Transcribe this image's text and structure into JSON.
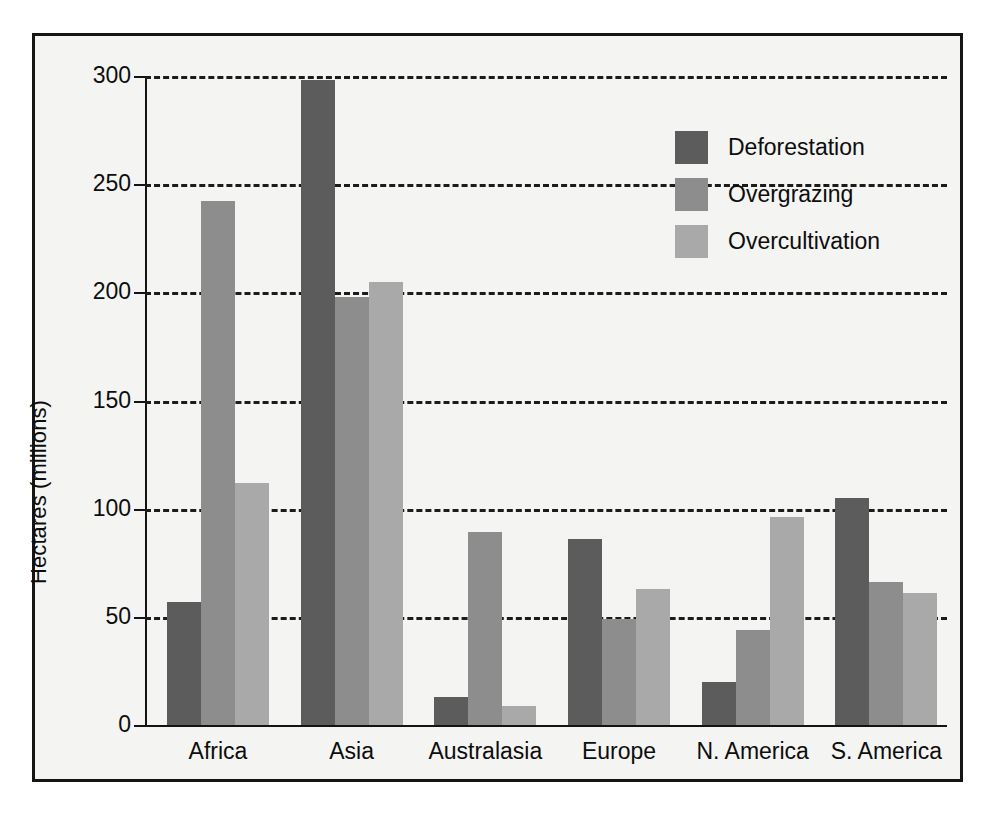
{
  "chart_data": {
    "type": "bar",
    "title": "",
    "xlabel": "",
    "ylabel": "Hectares (millions)",
    "ylim": [
      0,
      300
    ],
    "yticks": [
      0,
      50,
      100,
      150,
      200,
      250,
      300
    ],
    "ytick_labels": [
      "0",
      "50",
      "100",
      "150",
      "200",
      "250",
      "300"
    ],
    "grid": "horizontal-dashed",
    "legend_position": "upper-right-inside",
    "categories": [
      "Africa",
      "Asia",
      "Australasia",
      "Europe",
      "N. America",
      "S. America"
    ],
    "series": [
      {
        "name": "Deforestation",
        "color": "#5c5c5c",
        "values": [
          57,
          298,
          13,
          86,
          20,
          105
        ]
      },
      {
        "name": "Overgrazing",
        "color": "#8d8d8d",
        "values": [
          242,
          198,
          89,
          49,
          44,
          66
        ]
      },
      {
        "name": "Overcultivation",
        "color": "#a9a9a9",
        "values": [
          112,
          205,
          9,
          63,
          96,
          61
        ]
      }
    ]
  },
  "legend": {
    "items": [
      {
        "label": "Deforestation"
      },
      {
        "label": "Overgrazing"
      },
      {
        "label": "Overcultivation"
      }
    ]
  },
  "axes": {
    "y_title": "Hectares (millions)"
  }
}
